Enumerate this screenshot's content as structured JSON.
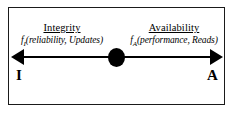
{
  "diagram": {
    "frame": {
      "border_color": "#1a1a1a"
    },
    "axis": {
      "color": "#000000",
      "left_arrowhead": "arrow-left",
      "right_arrowhead": "arrow-right",
      "center_marker": "filled-ellipse"
    },
    "poles": {
      "left": {
        "title": "Integrity",
        "formula_prefix": "f",
        "formula_subscript": "I",
        "formula_args": "(reliability, Updates)",
        "endpoint_letter": "I"
      },
      "right": {
        "title": "Availability",
        "formula_prefix": "f",
        "formula_subscript": "A",
        "formula_args": "(performance, Reads)",
        "endpoint_letter": "A"
      }
    }
  }
}
